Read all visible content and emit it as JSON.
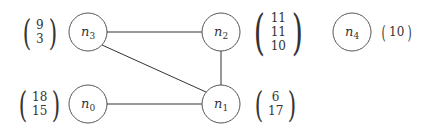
{
  "graph": {
    "nodes": [
      {
        "id": "n0",
        "label": "n",
        "sub": "0",
        "cx": 88,
        "cy": 104,
        "vector": [
          "18",
          "15"
        ]
      },
      {
        "id": "n1",
        "label": "n",
        "sub": "1",
        "cx": 221,
        "cy": 104,
        "vector": [
          "6",
          "17"
        ]
      },
      {
        "id": "n2",
        "label": "n",
        "sub": "2",
        "cx": 221,
        "cy": 32,
        "vector": [
          "11",
          "11",
          "10"
        ]
      },
      {
        "id": "n3",
        "label": "n",
        "sub": "3",
        "cx": 88,
        "cy": 32,
        "vector": [
          "9",
          "3"
        ]
      },
      {
        "id": "n4",
        "label": "n",
        "sub": "4",
        "cx": 352,
        "cy": 32,
        "vector": [
          "10"
        ]
      }
    ],
    "edges": [
      [
        "n3",
        "n2"
      ],
      [
        "n3",
        "n1"
      ],
      [
        "n2",
        "n1"
      ],
      [
        "n0",
        "n1"
      ]
    ],
    "colors": {
      "stroke": "#555555",
      "edge": "#333333",
      "text": "#333333"
    }
  }
}
